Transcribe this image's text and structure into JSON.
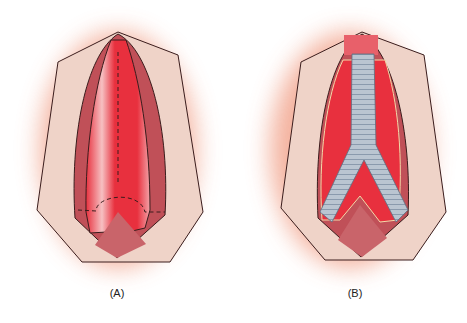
{
  "figure": {
    "panels": [
      {
        "id": "A",
        "label": "(A)",
        "description": "Opened aortic aneurysm sac with dashed incision lines"
      },
      {
        "id": "B",
        "label": "(B)",
        "description": "Bifurcated tube graft placed within opened aneurysm sac"
      }
    ],
    "colors": {
      "skin_glow": "#f2a58e",
      "skin_flap": "#efd3c8",
      "vessel_red": "#e8303e",
      "vessel_dark": "#b83a42",
      "vessel_light": "#f6c0c2",
      "graft": "#b9c4d0",
      "outline": "#3a1c1c"
    }
  }
}
